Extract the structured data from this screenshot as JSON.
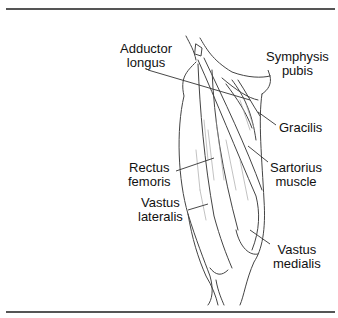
{
  "figure": {
    "labels": {
      "adductor_longus": [
        "Adductor",
        "longus"
      ],
      "symphysis_pubis": [
        "Symphysis",
        "pubis"
      ],
      "gracilis": [
        "Gracilis"
      ],
      "rectus_femoris": [
        "Rectus",
        "femoris"
      ],
      "sartorius_muscle": [
        "Sartorius",
        "muscle"
      ],
      "vastus_lateralis": [
        "Vastus",
        "lateralis"
      ],
      "vastus_medialis": [
        "Vastus",
        "medialis"
      ]
    }
  },
  "colors": {
    "rule": "#555555",
    "line": "#444444",
    "text": "#111111"
  }
}
